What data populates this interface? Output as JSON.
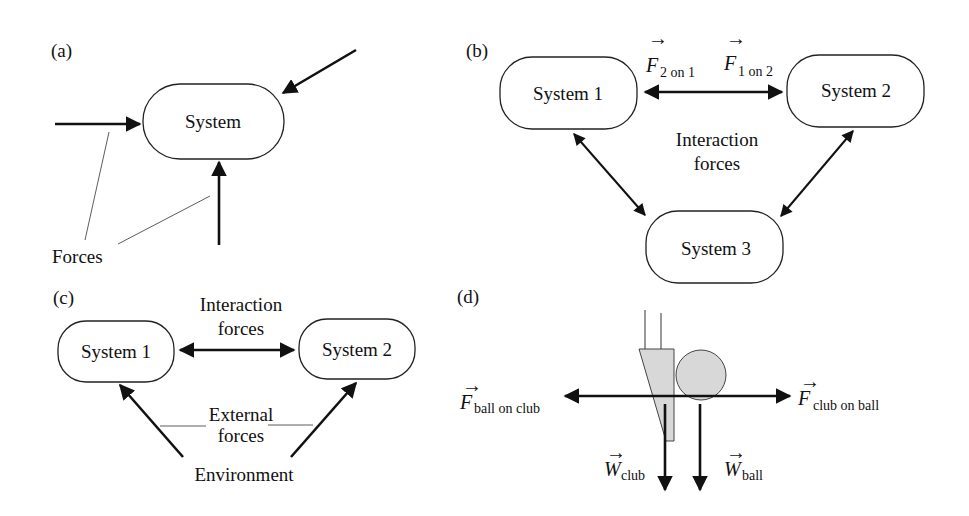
{
  "panels": {
    "a": {
      "label": "(a)",
      "system": "System",
      "forces_label": "Forces"
    },
    "b": {
      "label": "(b)",
      "system1": "System 1",
      "system2": "System 2",
      "system3": "System 3",
      "f21_symbol": "F",
      "f21_sub": "2 on 1",
      "f12_symbol": "F",
      "f12_sub": "1 on 2",
      "interaction_line1": "Interaction",
      "interaction_line2": "forces"
    },
    "c": {
      "label": "(c)",
      "system1": "System 1",
      "system2": "System 2",
      "interaction_line1": "Interaction",
      "interaction_line2": "forces",
      "external_line1": "External",
      "external_line2": "forces",
      "environment": "Environment"
    },
    "d": {
      "label": "(d)",
      "f_ball_on_club_symbol": "F",
      "f_ball_on_club_sub": "ball on club",
      "f_club_on_ball_symbol": "F",
      "f_club_on_ball_sub": "club on ball",
      "w_club_symbol": "W",
      "w_club_sub": "club",
      "w_ball_symbol": "W",
      "w_ball_sub": "ball",
      "object_fill": "#d8d8d8"
    }
  }
}
